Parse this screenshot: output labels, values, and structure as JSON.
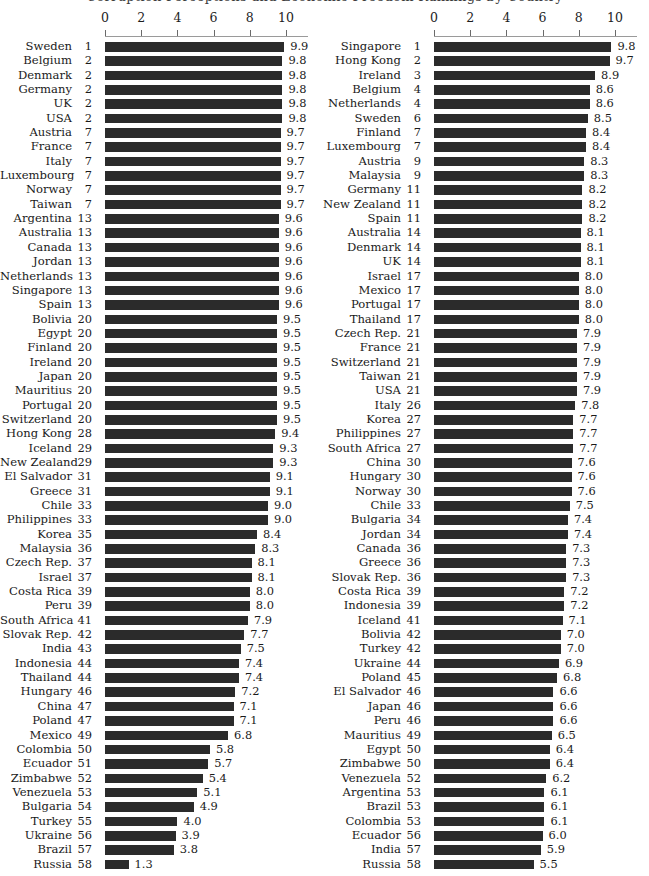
{
  "figure": {
    "title": "Corruption Perceptions and Economic Freedom Rankings by Country",
    "background": "#ffffff",
    "bar_color": "#2b2b2b",
    "text_color": "#1a1a1a"
  },
  "axis": {
    "ticks": [
      0,
      2,
      4,
      6,
      8,
      10
    ],
    "min": 0,
    "max": 10
  },
  "chart_data": [
    {
      "type": "bar",
      "orientation": "horizontal",
      "panel": "left",
      "title": "",
      "xlabel": "",
      "ylabel": "",
      "xlim": [
        0,
        10
      ],
      "xticks": [
        0,
        2,
        4,
        6,
        8,
        10
      ],
      "grid": false,
      "legend": "none",
      "columns": [
        "country",
        "rank",
        "value"
      ],
      "rows": [
        [
          "Sweden",
          1,
          9.9
        ],
        [
          "Belgium",
          2,
          9.8
        ],
        [
          "Denmark",
          2,
          9.8
        ],
        [
          "Germany",
          2,
          9.8
        ],
        [
          "UK",
          2,
          9.8
        ],
        [
          "USA",
          2,
          9.8
        ],
        [
          "Austria",
          7,
          9.7
        ],
        [
          "France",
          7,
          9.7
        ],
        [
          "Italy",
          7,
          9.7
        ],
        [
          "Luxembourg",
          7,
          9.7
        ],
        [
          "Norway",
          7,
          9.7
        ],
        [
          "Taiwan",
          7,
          9.7
        ],
        [
          "Argentina",
          13,
          9.6
        ],
        [
          "Australia",
          13,
          9.6
        ],
        [
          "Canada",
          13,
          9.6
        ],
        [
          "Jordan",
          13,
          9.6
        ],
        [
          "Netherlands",
          13,
          9.6
        ],
        [
          "Singapore",
          13,
          9.6
        ],
        [
          "Spain",
          13,
          9.6
        ],
        [
          "Bolivia",
          20,
          9.5
        ],
        [
          "Egypt",
          20,
          9.5
        ],
        [
          "Finland",
          20,
          9.5
        ],
        [
          "Ireland",
          20,
          9.5
        ],
        [
          "Japan",
          20,
          9.5
        ],
        [
          "Mauritius",
          20,
          9.5
        ],
        [
          "Portugal",
          20,
          9.5
        ],
        [
          "Switzerland",
          20,
          9.5
        ],
        [
          "Hong Kong",
          28,
          9.4
        ],
        [
          "Iceland",
          29,
          9.3
        ],
        [
          "New Zealand",
          29,
          9.3
        ],
        [
          "El Salvador",
          31,
          9.1
        ],
        [
          "Greece",
          31,
          9.1
        ],
        [
          "Chile",
          33,
          9.0
        ],
        [
          "Philippines",
          33,
          9.0
        ],
        [
          "Korea",
          35,
          8.4
        ],
        [
          "Malaysia",
          36,
          8.3
        ],
        [
          "Czech Rep.",
          37,
          8.1
        ],
        [
          "Israel",
          37,
          8.1
        ],
        [
          "Costa Rica",
          39,
          8.0
        ],
        [
          "Peru",
          39,
          8.0
        ],
        [
          "South Africa",
          41,
          7.9
        ],
        [
          "Slovak Rep.",
          42,
          7.7
        ],
        [
          "India",
          43,
          7.5
        ],
        [
          "Indonesia",
          44,
          7.4
        ],
        [
          "Thailand",
          44,
          7.4
        ],
        [
          "Hungary",
          46,
          7.2
        ],
        [
          "China",
          47,
          7.1
        ],
        [
          "Poland",
          47,
          7.1
        ],
        [
          "Mexico",
          49,
          6.8
        ],
        [
          "Colombia",
          50,
          5.8
        ],
        [
          "Ecuador",
          51,
          5.7
        ],
        [
          "Zimbabwe",
          52,
          5.4
        ],
        [
          "Venezuela",
          53,
          5.1
        ],
        [
          "Bulgaria",
          54,
          4.9
        ],
        [
          "Turkey",
          55,
          4.0
        ],
        [
          "Ukraine",
          56,
          3.9
        ],
        [
          "Brazil",
          57,
          3.8
        ],
        [
          "Russia",
          58,
          1.3
        ]
      ]
    },
    {
      "type": "bar",
      "orientation": "horizontal",
      "panel": "right",
      "title": "",
      "xlabel": "",
      "ylabel": "",
      "xlim": [
        0,
        10
      ],
      "xticks": [
        0,
        2,
        4,
        6,
        8,
        10
      ],
      "grid": false,
      "legend": "none",
      "columns": [
        "country",
        "rank",
        "value"
      ],
      "rows": [
        [
          "Singapore",
          1,
          9.8
        ],
        [
          "Hong Kong",
          2,
          9.7
        ],
        [
          "Ireland",
          3,
          8.9
        ],
        [
          "Belgium",
          4,
          8.6
        ],
        [
          "Netherlands",
          4,
          8.6
        ],
        [
          "Sweden",
          6,
          8.5
        ],
        [
          "Finland",
          7,
          8.4
        ],
        [
          "Luxembourg",
          7,
          8.4
        ],
        [
          "Austria",
          9,
          8.3
        ],
        [
          "Malaysia",
          9,
          8.3
        ],
        [
          "Germany",
          11,
          8.2
        ],
        [
          "New Zealand",
          11,
          8.2
        ],
        [
          "Spain",
          11,
          8.2
        ],
        [
          "Australia",
          14,
          8.1
        ],
        [
          "Denmark",
          14,
          8.1
        ],
        [
          "UK",
          14,
          8.1
        ],
        [
          "Israel",
          17,
          8.0
        ],
        [
          "Mexico",
          17,
          8.0
        ],
        [
          "Portugal",
          17,
          8.0
        ],
        [
          "Thailand",
          17,
          8.0
        ],
        [
          "Czech Rep.",
          21,
          7.9
        ],
        [
          "France",
          21,
          7.9
        ],
        [
          "Switzerland",
          21,
          7.9
        ],
        [
          "Taiwan",
          21,
          7.9
        ],
        [
          "USA",
          21,
          7.9
        ],
        [
          "Italy",
          26,
          7.8
        ],
        [
          "Korea",
          27,
          7.7
        ],
        [
          "Philippines",
          27,
          7.7
        ],
        [
          "South Africa",
          27,
          7.7
        ],
        [
          "China",
          30,
          7.6
        ],
        [
          "Hungary",
          30,
          7.6
        ],
        [
          "Norway",
          30,
          7.6
        ],
        [
          "Chile",
          33,
          7.5
        ],
        [
          "Bulgaria",
          34,
          7.4
        ],
        [
          "Jordan",
          34,
          7.4
        ],
        [
          "Canada",
          36,
          7.3
        ],
        [
          "Greece",
          36,
          7.3
        ],
        [
          "Slovak Rep.",
          36,
          7.3
        ],
        [
          "Costa Rica",
          39,
          7.2
        ],
        [
          "Indonesia",
          39,
          7.2
        ],
        [
          "Iceland",
          41,
          7.1
        ],
        [
          "Bolivia",
          42,
          7.0
        ],
        [
          "Turkey",
          42,
          7.0
        ],
        [
          "Ukraine",
          44,
          6.9
        ],
        [
          "Poland",
          45,
          6.8
        ],
        [
          "El Salvador",
          46,
          6.6
        ],
        [
          "Japan",
          46,
          6.6
        ],
        [
          "Peru",
          46,
          6.6
        ],
        [
          "Mauritius",
          49,
          6.5
        ],
        [
          "Egypt",
          50,
          6.4
        ],
        [
          "Zimbabwe",
          50,
          6.4
        ],
        [
          "Venezuela",
          52,
          6.2
        ],
        [
          "Argentina",
          53,
          6.1
        ],
        [
          "Brazil",
          53,
          6.1
        ],
        [
          "Colombia",
          53,
          6.1
        ],
        [
          "Ecuador",
          56,
          6.0
        ],
        [
          "India",
          57,
          5.9
        ],
        [
          "Russia",
          58,
          5.5
        ]
      ]
    }
  ]
}
